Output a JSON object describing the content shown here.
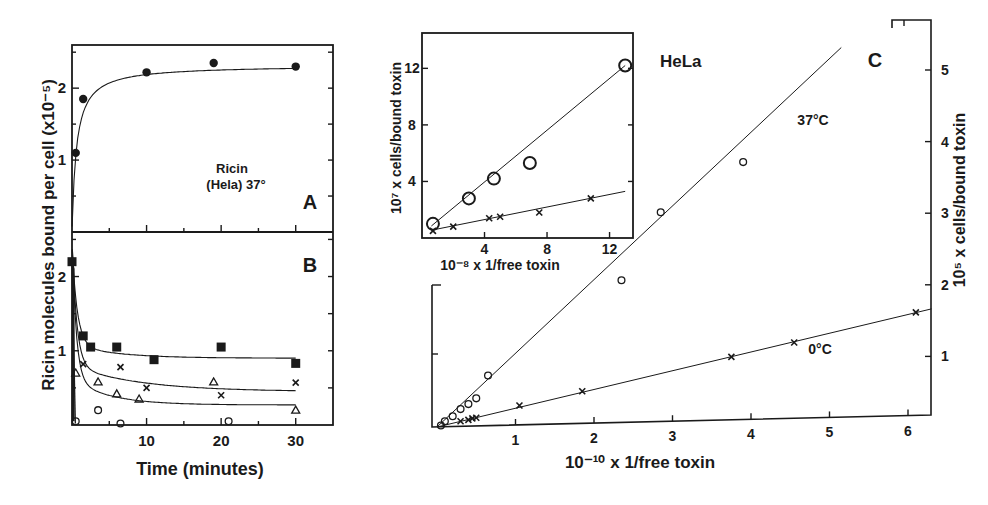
{
  "figure": {
    "panelA": {
      "letter": "A",
      "annotation_line1": "Ricin",
      "annotation_line2": "(Hela) 37°"
    },
    "panelB": {
      "letter": "B"
    },
    "shared_ylabel": "Ricin  molecules  bound per cell  (x10⁻⁵)",
    "shared_xlabel": "Time  (minutes)",
    "inset": {
      "title": "HeLa",
      "ylabel": "10⁷ x cells/bound toxin",
      "xlabel": "10⁻⁸ x 1/free toxin"
    },
    "panelC": {
      "letter": "C",
      "ylabel": "10⁵ x cells/bound toxin",
      "xlabel": "10⁻¹⁰ x 1/free toxin",
      "label_37": "37°C",
      "label_0": "0°C"
    }
  },
  "chart_data": [
    {
      "id": "A",
      "type": "scatter",
      "title": "Ricin (Hela) 37°",
      "xlabel": "Time (minutes)",
      "ylabel": "Ricin molecules bound per cell (x10^-5)",
      "xlim": [
        0,
        35
      ],
      "ylim": [
        0,
        2.6
      ],
      "xticks": [
        10,
        20,
        30
      ],
      "yticks": [
        1,
        2
      ],
      "series": [
        {
          "name": "Ricin bound (HeLa, 37°)",
          "marker": "filled-circle",
          "x": [
            0.5,
            1.5,
            10,
            19,
            30
          ],
          "y": [
            1.1,
            1.85,
            2.22,
            2.35,
            2.3
          ]
        }
      ],
      "fit_curve": "saturating, plateau ≈ 2.3"
    },
    {
      "id": "B",
      "type": "scatter",
      "xlabel": "Time (minutes)",
      "ylabel": "Ricin molecules bound per cell (x10^-5)",
      "xlim": [
        0,
        35
      ],
      "ylim": [
        0,
        2.6
      ],
      "xticks": [
        10,
        20,
        30
      ],
      "yticks": [
        1,
        2
      ],
      "series": [
        {
          "name": "filled squares",
          "marker": "filled-square",
          "x": [
            0,
            1.5,
            2.5,
            6,
            11,
            20,
            30
          ],
          "y": [
            2.2,
            1.2,
            1.05,
            1.05,
            0.88,
            1.05,
            0.83
          ]
        },
        {
          "name": "crosses",
          "marker": "x",
          "x": [
            1.5,
            6.5,
            10,
            20,
            30
          ],
          "y": [
            0.82,
            0.78,
            0.5,
            0.4,
            0.57
          ]
        },
        {
          "name": "triangles",
          "marker": "triangle",
          "x": [
            0.5,
            3.5,
            6,
            9,
            19,
            30
          ],
          "y": [
            0.7,
            0.58,
            0.42,
            0.35,
            0.58,
            0.2
          ]
        },
        {
          "name": "open circles",
          "marker": "open-circle",
          "x": [
            0.5,
            3.5,
            6.5,
            21
          ],
          "y": [
            0.05,
            0.2,
            0.02,
            0.05
          ]
        }
      ]
    },
    {
      "id": "C-inset",
      "type": "scatter",
      "title": "HeLa",
      "xlabel": "10^-8 x 1/free toxin",
      "ylabel": "10^7 x cells/bound toxin",
      "xlim": [
        0,
        13.5
      ],
      "ylim": [
        0,
        14.5
      ],
      "xticks": [
        4,
        8,
        12
      ],
      "yticks": [
        4,
        8,
        12
      ],
      "series": [
        {
          "name": "open circles",
          "marker": "open-circle",
          "x": [
            0.7,
            3,
            4.6,
            6.9,
            13
          ],
          "y": [
            1.0,
            2.8,
            4.2,
            5.3,
            12.2
          ]
        },
        {
          "name": "crosses",
          "marker": "x",
          "x": [
            0.7,
            2,
            4.3,
            5,
            7.5,
            10.8
          ],
          "y": [
            0.5,
            0.8,
            1.4,
            1.5,
            1.8,
            2.8
          ]
        }
      ]
    },
    {
      "id": "C",
      "type": "scatter",
      "xlabel": "10^-10 x 1/free toxin",
      "ylabel": "10^5 x cells/bound toxin",
      "xlim": [
        0,
        6.5
      ],
      "ylim": [
        0,
        5.4
      ],
      "xticks": [
        1,
        2,
        3,
        4,
        5,
        6
      ],
      "yticks": [
        1,
        2,
        3,
        4,
        5
      ],
      "series": [
        {
          "name": "37°C",
          "marker": "open-circle",
          "x": [
            0.05,
            0.1,
            0.2,
            0.3,
            0.4,
            0.5,
            0.65,
            2.35,
            2.85,
            3.9
          ],
          "y": [
            0.02,
            0.08,
            0.15,
            0.25,
            0.32,
            0.4,
            0.72,
            2.05,
            3.0,
            3.7
          ]
        },
        {
          "name": "0°C",
          "marker": "x",
          "x": [
            0.3,
            0.4,
            0.45,
            0.5,
            1.05,
            1.85,
            3.75,
            4.55,
            6.1
          ],
          "y": [
            0.08,
            0.1,
            0.12,
            0.13,
            0.3,
            0.5,
            0.98,
            1.18,
            1.6
          ]
        }
      ]
    }
  ]
}
